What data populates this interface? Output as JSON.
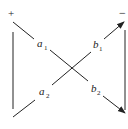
{
  "diagram": {
    "type": "two-port signal flow / cross-coupled network",
    "terminals": {
      "plus": "+",
      "minus": "−"
    },
    "labels": {
      "a1": {
        "base": "a",
        "sub": "1"
      },
      "a2": {
        "base": "a",
        "sub": "2"
      },
      "b1": {
        "base": "b",
        "sub": "1"
      },
      "b2": {
        "base": "b",
        "sub": "2"
      }
    },
    "colors": {
      "line": "#222222",
      "background": "#ffffff"
    }
  }
}
